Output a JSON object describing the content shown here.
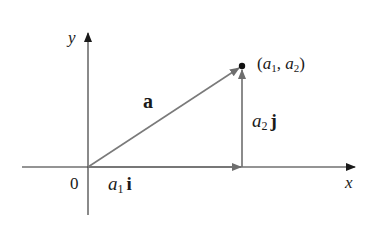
{
  "diagram": {
    "type": "vector-decomposition",
    "colors": {
      "axis": "#2a2a2a",
      "vector": "#7a7a7a",
      "component": "#6e6e6e",
      "point": "#111111",
      "text": "#1a1a1a"
    },
    "axes": {
      "x_label": "x",
      "y_label": "y",
      "origin_label": "0"
    },
    "vector_a": {
      "label": "a"
    },
    "point": {
      "label_open": "(",
      "a1": "a",
      "a1_sub": "1",
      "sep": ", ",
      "a2": "a",
      "a2_sub": "2",
      "label_close": ")"
    },
    "component_i": {
      "coef": "a",
      "coef_sub": "1",
      "unit": "i"
    },
    "component_j": {
      "coef": "a",
      "coef_sub": "2",
      "unit": "j"
    }
  }
}
